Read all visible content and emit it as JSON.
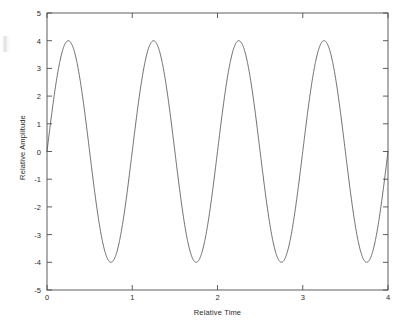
{
  "chart_data": {
    "type": "line",
    "title": "",
    "subtitle": "",
    "xlabel": "Relative Time",
    "ylabel": "Relative Amplitude",
    "xlim": [
      0,
      4
    ],
    "ylim": [
      -5,
      5
    ],
    "xticks": [
      "0",
      "1",
      "2",
      "3",
      "4"
    ],
    "xtick_values": [
      0,
      1,
      2,
      3,
      4
    ],
    "yticks": [
      "5",
      "4",
      "3",
      "2",
      "1",
      "0",
      "-1",
      "-2",
      "-3",
      "-4",
      "-5"
    ],
    "ytick_values": [
      5,
      4,
      3,
      2,
      1,
      0,
      -1,
      -2,
      -3,
      -4,
      -5
    ],
    "grid": false,
    "legend": null,
    "box": true,
    "tick_direction": "in",
    "line_color": "#4a4a4a",
    "line_width": 0.8,
    "series": [
      {
        "name": "sine wave",
        "description": "4 * sin(2*pi*t), amplitude 4, period 1, four full cycles",
        "amplitude": 4,
        "period": 1,
        "phase": 0,
        "x": [
          0,
          0.25,
          0.5,
          0.75,
          1,
          1.25,
          1.5,
          1.75,
          2,
          2.25,
          2.5,
          2.75,
          3,
          3.25,
          3.5,
          3.75,
          4
        ],
        "values": [
          0,
          4,
          0,
          -4,
          0,
          4,
          0,
          -4,
          0,
          4,
          0,
          -4,
          0,
          4,
          0,
          -4,
          0
        ]
      }
    ]
  },
  "axes": {
    "x_tick_labels": [
      "0",
      "1",
      "2",
      "3",
      "4"
    ],
    "y_tick_labels": [
      "5",
      "4",
      "3",
      "2",
      "1",
      "0",
      "-1",
      "-2",
      "-3",
      "-4",
      "-5"
    ],
    "x_axis_title": "Relative Time",
    "y_axis_title": "Relative Amplitude"
  },
  "colors": {
    "background": "#ffffff",
    "axis": "#4d4d4d",
    "curve": "#4a4a4a",
    "text": "#2b2b2b"
  }
}
